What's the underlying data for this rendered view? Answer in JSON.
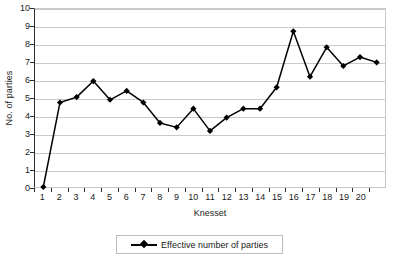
{
  "chart_data": {
    "type": "line",
    "title": "",
    "xlabel": "Knesset",
    "ylabel": "No. of parties",
    "xlim": [
      0,
      21
    ],
    "ylim": [
      0,
      10
    ],
    "grid": true,
    "legend_position": "bottom",
    "x_tick_labels": [
      "1",
      "2",
      "3",
      "4",
      "5",
      "6",
      "7",
      "8",
      "9",
      "10",
      "11",
      "12",
      "13",
      "14",
      "15",
      "16",
      "17",
      "18",
      "19",
      "20"
    ],
    "y_tick_labels": [
      "0",
      "1",
      "2",
      "3",
      "4",
      "5",
      "6",
      "7",
      "8",
      "9",
      "10"
    ],
    "series": [
      {
        "name": "Effective number of parties",
        "color": "#000000",
        "marker": "diamond",
        "x": [
          0,
          1,
          2,
          3,
          4,
          5,
          6,
          7,
          8,
          9,
          10,
          11,
          12,
          13,
          14,
          15,
          16,
          17,
          18,
          19,
          20
        ],
        "values": [
          0,
          4.75,
          5.05,
          5.95,
          4.9,
          5.4,
          4.75,
          3.6,
          3.35,
          4.4,
          3.15,
          3.9,
          4.4,
          4.4,
          5.6,
          8.75,
          6.2,
          7.85,
          6.8,
          7.3,
          7.0
        ]
      }
    ]
  },
  "legend": {
    "entries": [
      {
        "label": "Effective number of parties"
      }
    ]
  },
  "axes": {
    "x_title": "Knesset",
    "y_title": "No. of parties"
  }
}
